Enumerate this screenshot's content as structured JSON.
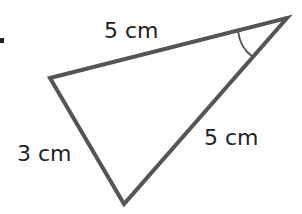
{
  "diagram": {
    "type": "triangle",
    "colors": {
      "stroke": "#555555",
      "text": "#222222",
      "background": "#ffffff"
    },
    "vertices": {
      "left": [
        50,
        78
      ],
      "top_right": [
        287,
        18
      ],
      "bottom": [
        124,
        204
      ]
    },
    "labels": {
      "top_side": "5 cm",
      "left_side": "3 cm",
      "right_side": "5 cm"
    },
    "angle_marker": {
      "vertex": "top_right",
      "style": "arc"
    }
  }
}
